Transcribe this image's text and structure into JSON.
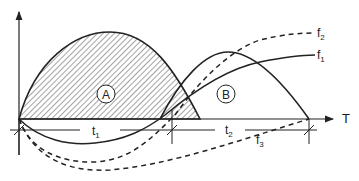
{
  "diagram": {
    "axis_label_t": "T",
    "regions": [
      {
        "id": "A",
        "label": "A",
        "hatched": true
      },
      {
        "id": "B",
        "label": "B",
        "hatched": false
      }
    ],
    "intervals": [
      {
        "label_main": "t",
        "label_sub": "1"
      },
      {
        "label_main": "t",
        "label_sub": "2"
      }
    ],
    "curves": [
      {
        "label_main": "f",
        "label_sub": "1",
        "style": "solid"
      },
      {
        "label_main": "f",
        "label_sub": "2",
        "style": "dashed"
      },
      {
        "label_main": "f",
        "label_sub": "3",
        "style": "dashed"
      }
    ],
    "colors": {
      "ink": "#222222",
      "background": "#ffffff"
    }
  }
}
